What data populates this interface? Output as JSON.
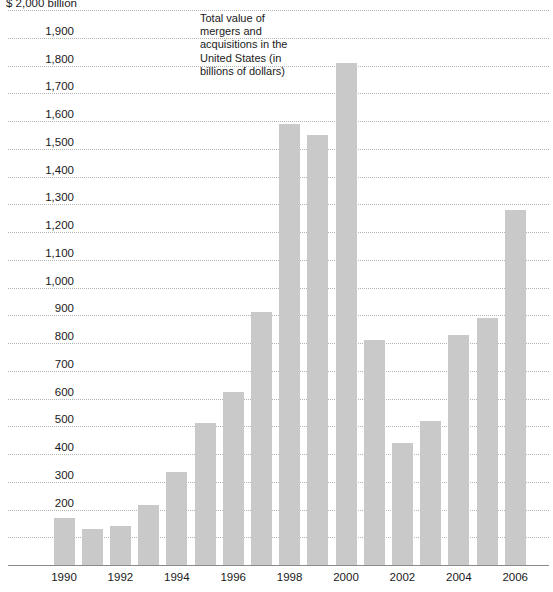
{
  "chart_data": {
    "type": "bar",
    "title": "",
    "annotation": "Total value of mergers and acquisitions in the United States (in billions of dollars)",
    "unit_label": "$ 2,000 billion",
    "xlabel": "",
    "ylabel": "",
    "ylim": [
      0,
      2000
    ],
    "ytick_step": 100,
    "grid": true,
    "legend": "none",
    "bar_color": "#c9c9c9",
    "categories": [
      "1990",
      "1991",
      "1992",
      "1993",
      "1994",
      "1995",
      "1996",
      "1997",
      "1998",
      "1999",
      "2000",
      "2001",
      "2002",
      "2003",
      "2004",
      "2005",
      "2006"
    ],
    "values": [
      170,
      130,
      140,
      215,
      335,
      510,
      625,
      910,
      1590,
      1550,
      1810,
      810,
      440,
      520,
      830,
      890,
      1280
    ],
    "xtick_labels": [
      "1990",
      "1992",
      "1994",
      "1996",
      "1998",
      "2000",
      "2002",
      "2004",
      "2006"
    ],
    "ytick_labels": [
      "$ 2,000 billion",
      "1,900",
      "1,800",
      "1,700",
      "1,600",
      "1,500",
      "1,400",
      "1,300",
      "1,200",
      "1,100",
      "1,000",
      "900",
      "800",
      "700",
      "600",
      "500",
      "400",
      "300",
      "200",
      "100",
      "0"
    ],
    "ytick_values": [
      2000,
      1900,
      1800,
      1700,
      1600,
      1500,
      1400,
      1300,
      1200,
      1100,
      1000,
      900,
      800,
      700,
      600,
      500,
      400,
      300,
      200,
      100,
      0
    ]
  }
}
